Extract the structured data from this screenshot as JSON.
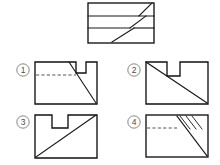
{
  "page": {
    "background_color": "#ffffff",
    "line_color": "#1a1a1a",
    "dashed_line_color": "#4a4a4a",
    "label_color": "#4a4a4a",
    "width": 220,
    "height": 165
  },
  "question_figure": {
    "name": "top-reference-view",
    "description": "Rectangle divided by two full-width horizontal lines into three bands, each band containing a short diagonal segment near its right side",
    "rect": {
      "x": 88,
      "y": 3,
      "w": 66,
      "h": 40
    },
    "horizontal_dividers_y": [
      16,
      28
    ],
    "diagonals": [
      {
        "x1": 139,
        "y1": 16,
        "x2": 152,
        "y2": 3
      },
      {
        "x1": 130,
        "y1": 28,
        "x2": 146,
        "y2": 16
      },
      {
        "x1": 112,
        "y1": 42,
        "x2": 134,
        "y2": 28
      }
    ],
    "inner_horizontals": [
      {
        "x1": 88,
        "y1": 28,
        "x2": 130,
        "y2": 28
      },
      {
        "x1": 134,
        "y1": 28,
        "x2": 154,
        "y2": 28
      }
    ]
  },
  "options": [
    {
      "id": "option-1",
      "number": "1",
      "label_center": {
        "x": 23,
        "y": 70
      },
      "rect": {
        "x": 35,
        "y": 62,
        "w": 62,
        "h": 42
      },
      "notch": {
        "x_left": 76,
        "x_right": 86,
        "depth_y": 73
      },
      "dashed_line": {
        "x1": 36,
        "y1": 75,
        "x2": 76,
        "y2": 75
      },
      "diagonal": {
        "x1": 69,
        "y1": 62,
        "x2": 96,
        "y2": 103
      },
      "has_dashed": true,
      "has_hatching": false
    },
    {
      "id": "option-2",
      "number": "2",
      "label_center": {
        "x": 134,
        "y": 70
      },
      "rect": {
        "x": 146,
        "y": 62,
        "w": 62,
        "h": 42
      },
      "notch": {
        "x_left": 167,
        "x_right": 180,
        "depth_y": 76
      },
      "diagonal": {
        "x1": 146,
        "y1": 62,
        "x2": 207,
        "y2": 103
      },
      "has_dashed": false,
      "has_hatching": false
    },
    {
      "id": "option-3",
      "number": "3",
      "label_center": {
        "x": 23,
        "y": 122
      },
      "rect": {
        "x": 35,
        "y": 115,
        "w": 62,
        "h": 43
      },
      "notch": {
        "x_left": 52,
        "x_right": 68,
        "depth_y": 128
      },
      "diagonal": {
        "x1": 36,
        "y1": 157,
        "x2": 96,
        "y2": 115
      },
      "has_dashed": false,
      "has_hatching": false
    },
    {
      "id": "option-4",
      "number": "4",
      "label_center": {
        "x": 134,
        "y": 122
      },
      "rect": {
        "x": 146,
        "y": 115,
        "w": 62,
        "h": 42
      },
      "dashed_line": {
        "x1": 147,
        "y1": 128,
        "x2": 177,
        "y2": 128
      },
      "diagonal": {
        "x1": 177,
        "y1": 116,
        "x2": 207,
        "y2": 156
      },
      "hatch_strokes": [
        {
          "x1": 180,
          "y1": 116,
          "x2": 190,
          "y2": 129
        },
        {
          "x1": 186,
          "y1": 116,
          "x2": 196,
          "y2": 129
        },
        {
          "x1": 192,
          "y1": 116,
          "x2": 202,
          "y2": 129
        }
      ],
      "has_dashed": true,
      "has_hatching": true
    }
  ]
}
